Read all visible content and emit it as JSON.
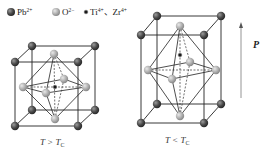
{
  "legend": {
    "items": [
      {
        "ion": "Pb",
        "charge": "2+",
        "type": "pb"
      },
      {
        "ion": "O",
        "charge": "2−",
        "type": "o"
      },
      {
        "ion": "Ti",
        "charge": "4+",
        "type": "ti",
        "suffix": "、",
        "extra_ion": "Zr",
        "extra_charge": "4+"
      }
    ]
  },
  "colors": {
    "pb": "#4a4a4a",
    "o": "#b0b0b0",
    "ti": "#1a1a1a",
    "edge": "#222222",
    "arrow": "#888888"
  },
  "structures": [
    {
      "name": "cubic-paraelectric",
      "caption_T": "T",
      "caption_rel": " > ",
      "caption_Tc": "T",
      "caption_sub": "C"
    },
    {
      "name": "tetragonal-ferroelectric",
      "caption_T": "T",
      "caption_rel": " < ",
      "caption_Tc": "T",
      "caption_sub": "C"
    }
  ],
  "polarization": {
    "label": "P",
    "direction": "up"
  }
}
